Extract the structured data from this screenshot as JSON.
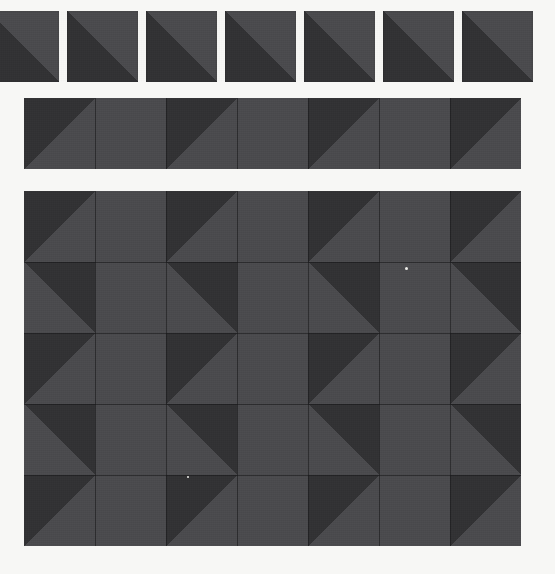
{
  "canvas": {
    "width": 555,
    "height": 574,
    "background_color": "#f7f7f5",
    "title": "Half-square triangle tile pattern sheet"
  },
  "palette": {
    "light": "#4a4a4d",
    "dark": "#313133",
    "gridline": "#141416",
    "background": "#f7f7f5",
    "speck": "#eeeeea"
  },
  "artifacts": [
    {
      "name": "white-speck",
      "x": 405,
      "y": 267,
      "size": 3
    },
    {
      "name": "white-speck-small",
      "x": 187,
      "y": 476,
      "size": 2
    }
  ],
  "sections": [
    {
      "id": "row-separated-tiles",
      "label": "Separated tile row",
      "x": -12,
      "y": 11,
      "tile_size": 71,
      "gap": 8,
      "count": 7,
      "rows": 1,
      "cols": 7,
      "contiguous": false,
      "gridlines": false,
      "tiles": [
        {
          "diagonal": "tlbr",
          "dark_half": "bottom-left"
        },
        {
          "diagonal": "tlbr",
          "dark_half": "bottom-left"
        },
        {
          "diagonal": "tlbr",
          "dark_half": "bottom-left"
        },
        {
          "diagonal": "tlbr",
          "dark_half": "bottom-left"
        },
        {
          "diagonal": "tlbr",
          "dark_half": "bottom-left"
        },
        {
          "diagonal": "tlbr",
          "dark_half": "bottom-left"
        },
        {
          "diagonal": "tlbr",
          "dark_half": "bottom-left"
        }
      ]
    },
    {
      "id": "row-contiguous-band",
      "label": "Contiguous zigzag band",
      "x": 24,
      "y": 98,
      "tile_size": 71,
      "gap": 0,
      "count": 7,
      "rows": 1,
      "cols": 7,
      "contiguous": true,
      "gridlines": true,
      "tiles": [
        {
          "diagonal": "trbl",
          "dark_half": "top-left"
        },
        {
          "diagonal": "tlbr",
          "dark_half": "bottom-right"
        },
        {
          "diagonal": "trbl",
          "dark_half": "top-left"
        },
        {
          "diagonal": "tlbr",
          "dark_half": "bottom-right"
        },
        {
          "diagonal": "trbl",
          "dark_half": "top-left"
        },
        {
          "diagonal": "tlbr",
          "dark_half": "bottom-right"
        },
        {
          "diagonal": "trbl",
          "dark_half": "top-left"
        }
      ]
    },
    {
      "id": "grid-large",
      "label": "Large diamond grid",
      "x": 24,
      "y": 191,
      "tile_size": 71,
      "gap": 0,
      "count": 35,
      "rows": 5,
      "cols": 7,
      "contiguous": true,
      "gridlines": true,
      "tiles": [
        {
          "diagonal": "trbl",
          "dark_half": "top-left"
        },
        {
          "diagonal": "tlbr",
          "dark_half": "bottom-right"
        },
        {
          "diagonal": "trbl",
          "dark_half": "top-left"
        },
        {
          "diagonal": "tlbr",
          "dark_half": "bottom-right"
        },
        {
          "diagonal": "trbl",
          "dark_half": "top-left"
        },
        {
          "diagonal": "tlbr",
          "dark_half": "bottom-right"
        },
        {
          "diagonal": "trbl",
          "dark_half": "top-left"
        },
        {
          "diagonal": "tlbr",
          "dark_half": "top-right"
        },
        {
          "diagonal": "trbl",
          "dark_half": "bottom-left"
        },
        {
          "diagonal": "tlbr",
          "dark_half": "top-right"
        },
        {
          "diagonal": "trbl",
          "dark_half": "bottom-left"
        },
        {
          "diagonal": "tlbr",
          "dark_half": "top-right"
        },
        {
          "diagonal": "trbl",
          "dark_half": "bottom-left"
        },
        {
          "diagonal": "tlbr",
          "dark_half": "top-right"
        },
        {
          "diagonal": "trbl",
          "dark_half": "top-left"
        },
        {
          "diagonal": "tlbr",
          "dark_half": "bottom-right"
        },
        {
          "diagonal": "trbl",
          "dark_half": "top-left"
        },
        {
          "diagonal": "tlbr",
          "dark_half": "bottom-right"
        },
        {
          "diagonal": "trbl",
          "dark_half": "top-left"
        },
        {
          "diagonal": "tlbr",
          "dark_half": "bottom-right"
        },
        {
          "diagonal": "trbl",
          "dark_half": "top-left"
        },
        {
          "diagonal": "tlbr",
          "dark_half": "top-right"
        },
        {
          "diagonal": "trbl",
          "dark_half": "bottom-left"
        },
        {
          "diagonal": "tlbr",
          "dark_half": "top-right"
        },
        {
          "diagonal": "trbl",
          "dark_half": "bottom-left"
        },
        {
          "diagonal": "tlbr",
          "dark_half": "top-right"
        },
        {
          "diagonal": "trbl",
          "dark_half": "bottom-left"
        },
        {
          "diagonal": "tlbr",
          "dark_half": "top-right"
        },
        {
          "diagonal": "trbl",
          "dark_half": "top-left"
        },
        {
          "diagonal": "tlbr",
          "dark_half": "bottom-right"
        },
        {
          "diagonal": "trbl",
          "dark_half": "top-left"
        },
        {
          "diagonal": "tlbr",
          "dark_half": "bottom-right"
        },
        {
          "diagonal": "trbl",
          "dark_half": "top-left"
        },
        {
          "diagonal": "tlbr",
          "dark_half": "bottom-right"
        },
        {
          "diagonal": "trbl",
          "dark_half": "top-left"
        }
      ]
    }
  ]
}
